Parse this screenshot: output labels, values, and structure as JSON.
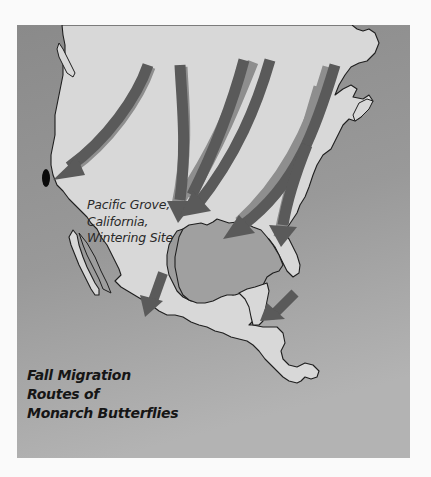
{
  "map": {
    "title_lines": [
      "Fall Migration",
      "Routes of",
      "Monarch Butterflies"
    ],
    "site_label_lines": [
      "Pacific Grove,",
      "California,",
      "Wintering Site"
    ],
    "colors": {
      "background": "#fafafa",
      "ocean_top": "#8c8c8c",
      "ocean_bottom": "#b0b0b0",
      "land": "#d8d8d8",
      "coastline": "#1e1e1e",
      "arrow": "#5a5a5a",
      "arrow_shadow": "#8e8e8e",
      "wintering_site": "#0a0a0a"
    },
    "regions": [
      "North America",
      "Gulf of Mexico",
      "Central America",
      "Pacific Ocean",
      "Atlantic Ocean"
    ],
    "arrows": [
      {
        "id": "west-route",
        "description": "from northwest interior toward Pacific Grove, California"
      },
      {
        "id": "central-route-1",
        "description": "from central plains southward"
      },
      {
        "id": "central-route-2",
        "description": "from northern plains merging southward"
      },
      {
        "id": "central-route-3",
        "description": "from north-central converging southwest"
      },
      {
        "id": "east-route-1",
        "description": "from northeast toward southwest"
      },
      {
        "id": "east-route-2",
        "description": "from northeast down eastern seaboard toward Florida"
      },
      {
        "id": "mexico-route",
        "description": "into central Mexico"
      },
      {
        "id": "gulf-route",
        "description": "from Florida across Gulf toward Yucatan"
      }
    ]
  }
}
